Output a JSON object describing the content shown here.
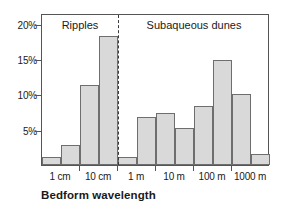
{
  "chart_data": {
    "type": "bar",
    "title": "",
    "xlabel": "Bedform wavelength",
    "ylabel": "",
    "ylim": [
      0,
      21.5
    ],
    "grid": false,
    "legend_position": "none",
    "x_scale": "logarithmic",
    "x_tick_labels": [
      "1 cm",
      "10 cm",
      "1 m",
      "10 m",
      "100 m",
      "1000 m"
    ],
    "y_tick_labels": [
      "5%",
      "10%",
      "15%",
      "20%"
    ],
    "y_tick_values": [
      5,
      10,
      15,
      20
    ],
    "categories": [
      "1 cm",
      "3 cm",
      "10 cm",
      "30 cm",
      "1 m",
      "3 m",
      "10 m",
      "30 m",
      "100 m",
      "300 m",
      "1000 m",
      "3000 m"
    ],
    "values": [
      1.2,
      2.8,
      11.3,
      18.2,
      1.2,
      6.8,
      7.4,
      5.3,
      8.4,
      14.9,
      10.1,
      1.6
    ],
    "annotations": [
      {
        "text": "Ripples",
        "region": "left-of-divider"
      },
      {
        "text": "Subaqueous dunes",
        "region": "right-of-divider"
      }
    ],
    "divider": {
      "label": "",
      "at_category_index": 4,
      "style": "dashed"
    },
    "colors": {
      "bar_fill": "#d9d9d9",
      "bar_edge": "#6e6e6e",
      "axis": "#555555",
      "text": "#1a1a1a"
    }
  }
}
